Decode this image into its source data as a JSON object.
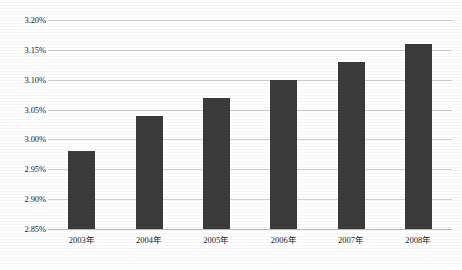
{
  "chart_data": {
    "type": "bar",
    "title": "",
    "subtitle": "",
    "xlabel": "",
    "ylabel": "",
    "categories": [
      "2003年",
      "2004年",
      "2005年",
      "2006年",
      "2007年",
      "2008年"
    ],
    "values": [
      2.98,
      3.04,
      3.07,
      3.1,
      3.13,
      3.16
    ],
    "value_unit": "%",
    "ylim": [
      2.85,
      3.2
    ],
    "ytick_labels": [
      "3.20%",
      "3.15%",
      "3.10%",
      "3.05%",
      "3.00%",
      "2.95%",
      "2.90%",
      "2.85%"
    ],
    "ytick_values": [
      3.2,
      3.15,
      3.1,
      3.05,
      3.0,
      2.95,
      2.9,
      2.85
    ],
    "grid": true,
    "legend": false,
    "legend_position": "none",
    "series": [
      {
        "name": "",
        "values": [
          2.98,
          3.04,
          3.07,
          3.1,
          3.13,
          3.16
        ]
      }
    ],
    "colors": {
      "bar": "#3b3b3b",
      "gridline": "#cfcfcf",
      "axis": "#b8b8b8",
      "background": "#ffffff",
      "text": "#1c1c1c"
    }
  }
}
